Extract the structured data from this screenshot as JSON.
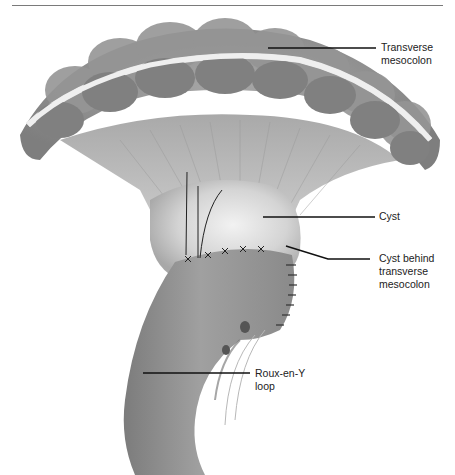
{
  "figure": {
    "colors": {
      "background": "#ffffff",
      "tissue_dark": "#8a8a8a",
      "tissue_mid": "#b0b0b0",
      "tissue_light": "#dcdcdc",
      "leader": "#111111"
    }
  },
  "labels": {
    "transverse_mesocolon": {
      "line1": "Transverse",
      "line2": "mesocolon"
    },
    "cyst": {
      "line1": "Cyst"
    },
    "cyst_behind": {
      "line1": "Cyst behind",
      "line2": "transverse",
      "line3": "mesocolon"
    },
    "roux_loop": {
      "line1": "Roux-en-Y",
      "line2": "loop"
    }
  }
}
